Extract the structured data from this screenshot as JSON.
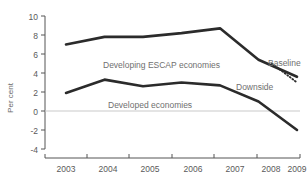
{
  "chart_data": {
    "type": "line",
    "title": "",
    "xlabel": "",
    "ylabel": "Per cent",
    "categories": [
      "2003",
      "2004",
      "2005",
      "2006",
      "2007",
      "2008",
      "2009"
    ],
    "x": [
      2003,
      2004,
      2005,
      2006,
      2007,
      2008,
      2009
    ],
    "ylim": [
      -4,
      10
    ],
    "xlim": [
      2003,
      2009
    ],
    "yticks": [
      "10",
      "8",
      "6",
      "4",
      "2",
      "0",
      "-2",
      "-4"
    ],
    "ytick_values": [
      10,
      8,
      6,
      4,
      2,
      0,
      -2,
      -4
    ],
    "grid": false,
    "legend_position": "inline-annotations",
    "zero_line": true,
    "series": [
      {
        "name": "Developing ESCAP economies",
        "style": "solid",
        "color": "#2b2b2b",
        "x": [
          2003,
          2004,
          2005,
          2006,
          2007,
          2008,
          2009
        ],
        "values": [
          7.0,
          7.8,
          7.8,
          8.2,
          8.7,
          5.4,
          3.6
        ]
      },
      {
        "name": "Downside",
        "style": "dotted",
        "color": "#2b2b2b",
        "x": [
          2008.35,
          2009
        ],
        "values": [
          5.0,
          3.0
        ]
      },
      {
        "name": "Developed economies",
        "style": "solid",
        "color": "#2b2b2b",
        "x": [
          2003,
          2004,
          2005,
          2006,
          2007,
          2008,
          2009
        ],
        "values": [
          1.9,
          3.3,
          2.6,
          3.0,
          2.7,
          1.0,
          -2.0
        ]
      }
    ],
    "annotations": [
      {
        "key": "developing",
        "text": "Developing ESCAP economies",
        "x": 103,
        "y": 68
      },
      {
        "key": "developed",
        "text": "Developed economies",
        "x": 108,
        "y": 108
      },
      {
        "key": "baseline",
        "text": "Baseline",
        "x": 268,
        "y": 66
      },
      {
        "key": "downside",
        "text": "Downside",
        "x": 236,
        "y": 90
      }
    ]
  },
  "axes": {
    "y_title": "Per cent",
    "y_ticks": [
      "10",
      "8",
      "6",
      "4",
      "2",
      "0",
      "-2",
      "-4"
    ],
    "x_ticks": [
      "2003",
      "2004",
      "2005",
      "2006",
      "2007",
      "2008",
      "2009"
    ]
  }
}
